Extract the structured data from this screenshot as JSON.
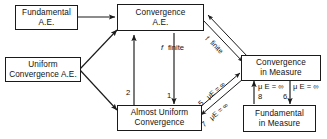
{
  "diagram": {
    "background_color": "#ffffff",
    "line_color": "#1a1a1a",
    "text_color": "#111111",
    "nodes": [
      {
        "id": "fundamental_ae",
        "lines": [
          "Fundamental",
          "A.E."
        ]
      },
      {
        "id": "uniform_conv_ae",
        "lines": [
          "Uniform",
          "Convergence A.E."
        ]
      },
      {
        "id": "convergence_ae",
        "lines": [
          "Convergence",
          "A.E."
        ]
      },
      {
        "id": "almost_uniform_conv",
        "lines": [
          "Almost Uniform",
          "Convergence"
        ]
      },
      {
        "id": "convergence_measure",
        "lines": [
          "Convergence",
          "in Measure"
        ]
      },
      {
        "id": "fundamental_measure",
        "lines": [
          "Fundamental",
          "in Measure"
        ]
      }
    ],
    "edge_labels": {
      "f_finite_vertical": "f",
      "f_finite_vertical_w": "finite",
      "f_finite_diagonal": "f",
      "f_finite_diagonal_w": "finite",
      "arrow_2": "2",
      "arrow_1": "1",
      "arrow_5": "5",
      "arrow_7": "7",
      "arrow_8": "8",
      "arrow_6": "6",
      "mu_5": "μE = ∞",
      "mu_7": "μE = ∞",
      "mu_left": "μ E = ∞",
      "mu_right": "μ E = ∞"
    }
  }
}
